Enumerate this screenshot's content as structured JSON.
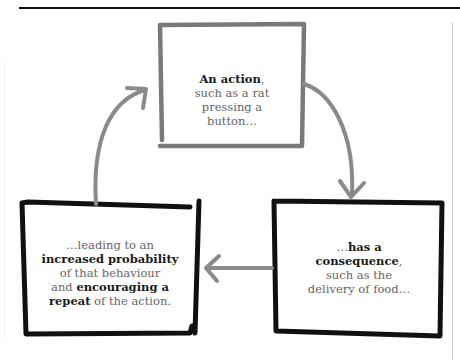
{
  "diagram": {
    "colors": {
      "rule": "#111111",
      "top_box_border": "#7a7a7a",
      "bottom_box_border": "#111111",
      "arrow": "#8a8a8a",
      "text_normal": "#666666",
      "text_bold": "#1a1a1a"
    },
    "nodes": {
      "action": {
        "bold": "An action",
        "after_bold": ",",
        "lines": [
          "such as a rat",
          "pressing a",
          "button…"
        ]
      },
      "consequence": {
        "prefix": "…",
        "bold1": "has a",
        "bold2": "consequence",
        "after_bold2": ",",
        "lines": [
          "such as the",
          "delivery of food…"
        ]
      },
      "repeat": {
        "line1": "…leading to an",
        "bold1": "increased probability",
        "line3": "of that behaviour",
        "line4_prefix": "and ",
        "bold2": "encouraging a",
        "bold3": "repeat",
        "line5_suffix": " of the action."
      }
    },
    "edges": [
      {
        "from": "action",
        "to": "consequence",
        "icon": "curved-arrow-down-icon"
      },
      {
        "from": "consequence",
        "to": "repeat",
        "icon": "arrow-left-icon"
      },
      {
        "from": "repeat",
        "to": "action",
        "icon": "curved-arrow-up-icon"
      }
    ]
  }
}
